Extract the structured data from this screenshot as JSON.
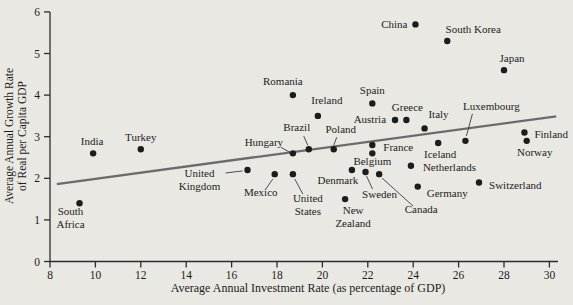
{
  "figure": {
    "background_color": "#e9e8e3",
    "axis_color": "#2b2b2b",
    "dot_color": "#1c1c1c",
    "trend_color": "#6b6b6b",
    "leader_color": "#3a3a3a",
    "label_color": "#1c1c1c"
  },
  "chart_data": {
    "type": "scatter",
    "title": "",
    "xlabel": "Average Annual Investment Rate (as percentage of GDP)",
    "ylabel": "Average Annual Growth Rate of Real per Capita GDP",
    "ylabel_lines": [
      "Average Annual Growth Rate",
      "of Real per Capita GDP"
    ],
    "xlim": [
      8,
      30
    ],
    "ylim": [
      0,
      6
    ],
    "xticks": [
      8,
      10,
      12,
      14,
      16,
      18,
      20,
      22,
      24,
      26,
      28,
      30
    ],
    "yticks": [
      0,
      1,
      2,
      3,
      4,
      5,
      6
    ],
    "grid": false,
    "legend": "none",
    "trend_line": {
      "x1": 8.3,
      "y1": 1.86,
      "x2": 30.3,
      "y2": 3.49
    },
    "points": [
      {
        "name": "South Africa",
        "x": 9.3,
        "y": 1.4,
        "lines": [
          "South",
          "Africa"
        ],
        "anchor": "middle",
        "dx": -9,
        "dy": 12
      },
      {
        "name": "India",
        "x": 9.9,
        "y": 2.6,
        "lines": [
          "India"
        ],
        "anchor": "middle",
        "dx": -1,
        "dy": -8
      },
      {
        "name": "Turkey",
        "x": 12,
        "y": 2.7,
        "lines": [
          "Turkey"
        ],
        "anchor": "middle",
        "dx": 0,
        "dy": -8
      },
      {
        "name": "United Kingdom",
        "x": 16.7,
        "y": 2.2,
        "lines": [
          "United",
          "Kingdom"
        ],
        "anchor": "middle",
        "dx": -48,
        "dy": 7,
        "leader": [
          -22,
          3,
          -5,
          1
        ]
      },
      {
        "name": "Mexico",
        "x": 17.9,
        "y": 2.1,
        "lines": [
          "Mexico"
        ],
        "anchor": "middle",
        "dx": -14,
        "dy": 22,
        "leader": [
          -9,
          15,
          -2,
          5
        ]
      },
      {
        "name": "Hungary",
        "x": 18.7,
        "y": 2.6,
        "lines": [
          "Hungary"
        ],
        "anchor": "middle",
        "dx": -29,
        "dy": -7,
        "leader": [
          -12,
          -6,
          -3,
          -1
        ]
      },
      {
        "name": "United States",
        "x": 18.7,
        "y": 2.1,
        "lines": [
          "United",
          "States"
        ],
        "anchor": "middle",
        "dx": 15,
        "dy": 28,
        "leader": [
          2,
          5,
          10,
          20
        ]
      },
      {
        "name": "Brazil",
        "x": 19.4,
        "y": 2.7,
        "lines": [
          "Brazil"
        ],
        "anchor": "middle",
        "dx": -12,
        "dy": -18,
        "leader": [
          -5,
          -13,
          -1,
          -4
        ]
      },
      {
        "name": "Romania",
        "x": 18.7,
        "y": 4.0,
        "lines": [
          "Romania"
        ],
        "anchor": "middle",
        "dx": -10,
        "dy": -10
      },
      {
        "name": "Ireland",
        "x": 19.8,
        "y": 3.5,
        "lines": [
          "Ireland"
        ],
        "anchor": "middle",
        "dx": 9,
        "dy": -12
      },
      {
        "name": "Poland",
        "x": 20.5,
        "y": 2.7,
        "lines": [
          "Poland"
        ],
        "anchor": "middle",
        "dx": 7,
        "dy": -16,
        "leader": [
          3,
          -12,
          0,
          -4
        ]
      },
      {
        "name": "Spain",
        "x": 22.2,
        "y": 3.8,
        "lines": [
          "Spain"
        ],
        "anchor": "middle",
        "dx": 0,
        "dy": -9
      },
      {
        "name": "Austria",
        "x": 23.2,
        "y": 3.4,
        "lines": [
          "Austria"
        ],
        "anchor": "end",
        "dx": -9,
        "dy": 3
      },
      {
        "name": "Greece",
        "x": 23.7,
        "y": 3.4,
        "lines": [
          "Greece"
        ],
        "anchor": "middle",
        "dx": 1,
        "dy": -9
      },
      {
        "name": "Italy",
        "x": 24.5,
        "y": 3.2,
        "lines": [
          "Italy"
        ],
        "anchor": "middle",
        "dx": 14,
        "dy": -10
      },
      {
        "name": "France",
        "x": 22.2,
        "y": 2.8,
        "lines": [
          "France"
        ],
        "anchor": "start",
        "dx": 11,
        "dy": 6
      },
      {
        "name": "Belgium",
        "x": 22.2,
        "y": 2.6,
        "lines": [
          "Belgium"
        ],
        "anchor": "middle",
        "dx": 0,
        "dy": 12
      },
      {
        "name": "Denmark",
        "x": 21.3,
        "y": 2.2,
        "lines": [
          "Denmark"
        ],
        "anchor": "middle",
        "dx": -14,
        "dy": 14
      },
      {
        "name": "Sweden",
        "x": 21.9,
        "y": 2.15,
        "lines": [
          "Sweden"
        ],
        "anchor": "middle",
        "dx": 14,
        "dy": 26,
        "leader": [
          1,
          4,
          7,
          17
        ]
      },
      {
        "name": "Canada",
        "x": 22.5,
        "y": 2.1,
        "lines": [
          "Canada"
        ],
        "anchor": "middle",
        "dx": 42,
        "dy": 39,
        "leader": [
          3,
          4,
          34,
          32
        ]
      },
      {
        "name": "New Zealand",
        "x": 21,
        "y": 1.5,
        "lines": [
          "New",
          "Zealand"
        ],
        "anchor": "middle",
        "dx": 8,
        "dy": 15
      },
      {
        "name": "Netherlands",
        "x": 23.9,
        "y": 2.3,
        "lines": [
          "Netherlands"
        ],
        "anchor": "start",
        "dx": 12,
        "dy": 5
      },
      {
        "name": "Iceland",
        "x": 25.1,
        "y": 2.85,
        "lines": [
          "Iceland"
        ],
        "anchor": "middle",
        "dx": 2,
        "dy": 15
      },
      {
        "name": "Germany",
        "x": 24.2,
        "y": 1.8,
        "lines": [
          "Germany"
        ],
        "anchor": "start",
        "dx": 9,
        "dy": 10
      },
      {
        "name": "Switzerland",
        "x": 26.9,
        "y": 1.9,
        "lines": [
          "Switzerland"
        ],
        "anchor": "start",
        "dx": 10,
        "dy": 7
      },
      {
        "name": "Luxembourg",
        "x": 26.3,
        "y": 2.9,
        "lines": [
          "Luxembourg"
        ],
        "anchor": "middle",
        "dx": 26,
        "dy": -31,
        "leader": [
          7,
          -27,
          1,
          -5
        ]
      },
      {
        "name": "China",
        "x": 24.1,
        "y": 5.7,
        "lines": [
          "China"
        ],
        "anchor": "end",
        "dx": -8,
        "dy": 4
      },
      {
        "name": "South Korea",
        "x": 25.5,
        "y": 5.3,
        "lines": [
          "South Korea"
        ],
        "anchor": "middle",
        "dx": 26,
        "dy": -8
      },
      {
        "name": "Japan",
        "x": 28,
        "y": 4.6,
        "lines": [
          "Japan"
        ],
        "anchor": "middle",
        "dx": 8,
        "dy": -8
      },
      {
        "name": "Finland",
        "x": 28.9,
        "y": 3.1,
        "lines": [
          "Finland"
        ],
        "anchor": "start",
        "dx": 10,
        "dy": 5
      },
      {
        "name": "Norway",
        "x": 29,
        "y": 2.9,
        "lines": [
          "Norway"
        ],
        "anchor": "middle",
        "dx": 8,
        "dy": 15
      }
    ]
  }
}
